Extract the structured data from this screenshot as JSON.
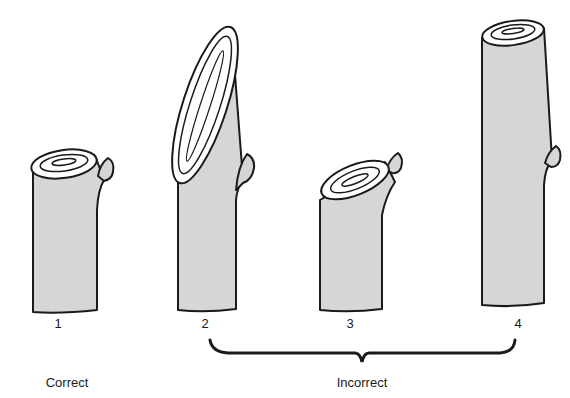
{
  "figure": {
    "stems": [
      {
        "number": "1",
        "verdict": "correct"
      },
      {
        "number": "2",
        "verdict": "incorrect"
      },
      {
        "number": "3",
        "verdict": "incorrect"
      },
      {
        "number": "4",
        "verdict": "incorrect"
      }
    ],
    "labels": {
      "correct": "Correct",
      "incorrect": "Incorrect"
    },
    "colors": {
      "stem_fill": "#d6d6d6",
      "outline": "#1a1a1a",
      "cut_face": "#ffffff"
    }
  }
}
